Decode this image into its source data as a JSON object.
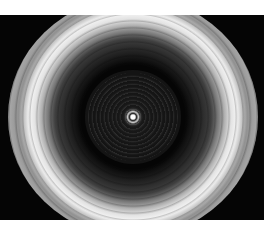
{
  "image": {
    "subject": "concentric ring interference pattern",
    "colors": {
      "background": "#050505",
      "ring": "#f0f0f0",
      "page": "#ffffff"
    }
  }
}
